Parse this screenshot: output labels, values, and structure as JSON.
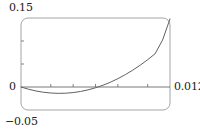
{
  "figure": {
    "frame": {
      "x0": 21,
      "y0": 18,
      "x1": 170,
      "y1": 110,
      "corner_radius": 7,
      "stroke": "#8d8d8d",
      "stroke_width": 0.8
    },
    "axis_line": {
      "y_px": 87,
      "stroke": "#555555",
      "stroke_width": 0.8
    },
    "curve": {
      "stroke": "#606060",
      "stroke_width": 1.0
    }
  },
  "labels": {
    "y_max": "0.15",
    "y_min": "−0.05",
    "origin": "0",
    "x_max": "0.012"
  },
  "chart_data": {
    "type": "line",
    "title": "",
    "xlabel": "",
    "ylabel": "",
    "xlim": [
      0,
      0.012
    ],
    "ylim": [
      -0.05,
      0.15
    ],
    "grid": false,
    "legend": null,
    "axis_tick_labels": {
      "x": [
        "0",
        "0.012"
      ],
      "y": [
        "−0.05",
        "0",
        "0.15"
      ]
    },
    "x_ticks": [
      0.0024,
      0.0042,
      0.006,
      0.0078,
      0.0102
    ],
    "y_ticks": [
      0.05,
      0.1
    ],
    "series": [
      {
        "name": "curve",
        "x": [
          0.0,
          0.0006,
          0.0012,
          0.0018,
          0.0024,
          0.003,
          0.0036,
          0.0042,
          0.0048,
          0.0054,
          0.006,
          0.0066,
          0.0072,
          0.0078,
          0.0084,
          0.009,
          0.0096,
          0.0102,
          0.0108,
          0.0114,
          0.012
        ],
        "y": [
          0.0,
          -0.0048,
          -0.0086,
          -0.0114,
          -0.0131,
          -0.0138,
          -0.0135,
          -0.0121,
          -0.0097,
          -0.0062,
          -0.0017,
          0.0038,
          0.0104,
          0.0181,
          0.0268,
          0.0366,
          0.0474,
          0.0593,
          0.0723,
          0.102,
          0.148
        ]
      }
    ]
  }
}
